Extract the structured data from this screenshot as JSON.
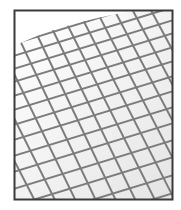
{
  "figure": {
    "frame_color": "#3a3a3a",
    "mesh_color": "#7a7a7a",
    "background_color": "#ffffff",
    "shading_color": "#eeeeee"
  }
}
